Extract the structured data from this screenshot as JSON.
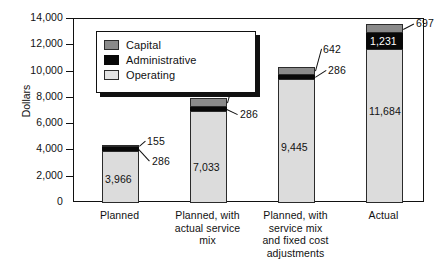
{
  "chart_data": {
    "type": "bar",
    "subtype": "stacked-vertical",
    "title": "",
    "xlabel": "",
    "ylabel": "Dollars",
    "ylim": [
      0,
      14000
    ],
    "ytick_interval": 2000,
    "ytick_labels": [
      "0",
      "2,000",
      "4,000",
      "6,000",
      "8,000",
      "10,000",
      "12,000",
      "14,000"
    ],
    "ytick_values": [
      0,
      2000,
      4000,
      6000,
      8000,
      10000,
      12000,
      14000
    ],
    "grid": false,
    "legend_position": "upper-left-inside",
    "categories": [
      "Planned",
      "Planned, with actual service mix",
      "Planned, with service mix and fixed cost adjustments",
      "Actual"
    ],
    "category_lines": [
      [
        "Planned"
      ],
      [
        "Planned, with",
        "actual service",
        "mix"
      ],
      [
        "Planned, with",
        "service mix",
        "and fixed cost",
        "adjustments"
      ],
      [
        "Actual"
      ]
    ],
    "series": [
      {
        "name": "Operating",
        "color": "#dcdcdc",
        "values": [
          3966,
          7033,
          9445,
          11684
        ],
        "labels": [
          "3,966",
          "7,033",
          "9,445",
          "11,684"
        ]
      },
      {
        "name": "Administrative",
        "color": "#080808",
        "values": [
          286,
          286,
          286,
          1231
        ],
        "labels": [
          "286",
          "286",
          "286",
          "1,231"
        ]
      },
      {
        "name": "Capital",
        "color": "#8a8a8a",
        "values": [
          155,
          642,
          642,
          697
        ],
        "labels": [
          "155",
          "642",
          "642",
          "697"
        ]
      }
    ],
    "totals": [
      4407,
      7961,
      10373,
      13612
    ],
    "annotations": [
      {
        "bar": 0,
        "series": "Capital",
        "text": "155",
        "style": "leader-line"
      },
      {
        "bar": 0,
        "series": "Administrative",
        "text": "286",
        "style": "leader-line"
      },
      {
        "bar": 1,
        "series": "Capital",
        "text": "642",
        "style": "leader-line"
      },
      {
        "bar": 1,
        "series": "Administrative",
        "text": "286",
        "style": "leader-line"
      },
      {
        "bar": 2,
        "series": "Capital",
        "text": "642",
        "style": "leader-line"
      },
      {
        "bar": 2,
        "series": "Administrative",
        "text": "286",
        "style": "leader-line"
      },
      {
        "bar": 3,
        "series": "Capital",
        "text": "697",
        "style": "leader-line"
      },
      {
        "bar": 3,
        "series": "Administrative",
        "text": "1,231",
        "style": "inside-white"
      },
      {
        "bar": 0,
        "series": "Operating",
        "text": "3,966",
        "style": "inside"
      },
      {
        "bar": 1,
        "series": "Operating",
        "text": "7,033",
        "style": "inside"
      },
      {
        "bar": 2,
        "series": "Operating",
        "text": "9,445",
        "style": "inside"
      },
      {
        "bar": 3,
        "series": "Operating",
        "text": "11,684",
        "style": "inside"
      }
    ]
  },
  "legend": {
    "items": [
      {
        "label": "Capital",
        "swatch": "capital"
      },
      {
        "label": "Administrative",
        "swatch": "administrative"
      },
      {
        "label": "Operating",
        "swatch": "operating"
      }
    ]
  },
  "axis": {
    "y_title": "Dollars"
  },
  "colors": {
    "capital": "#8a8a8a",
    "administrative": "#080808",
    "operating": "#dcdcdc",
    "axis": "#111111",
    "background": "#ffffff"
  }
}
